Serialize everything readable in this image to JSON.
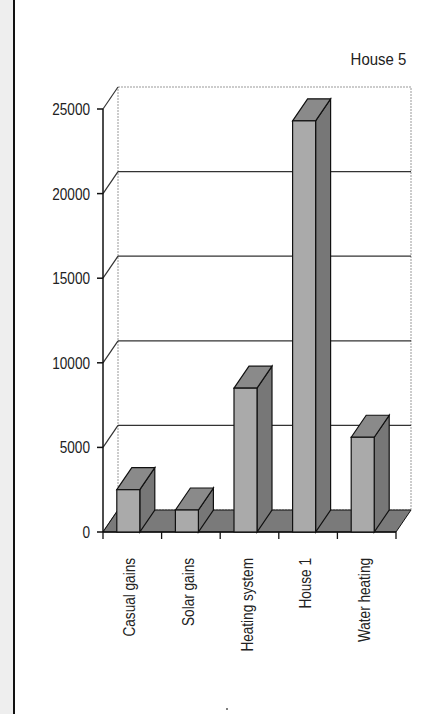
{
  "chart_data": {
    "type": "bar",
    "title": "House 5",
    "style": "3d-column",
    "categories": [
      "Casual gains",
      "Solar gains",
      "Heating system",
      "House 1",
      "Water heating"
    ],
    "series": [
      {
        "name": "House 5",
        "values": [
          2500,
          1300,
          8500,
          24300,
          5600
        ]
      }
    ],
    "xlabel": "",
    "ylabel": "",
    "ylim": [
      0,
      25000
    ],
    "yticks": [
      "0",
      "5000",
      "10000",
      "15000",
      "20000",
      "25000"
    ],
    "grid": true,
    "legend": null,
    "colors": {
      "bar_front": "#aaaaaa",
      "bar_side": "#777777",
      "bar_top": "#8a8a8a",
      "floor": "#7a7a7a"
    }
  },
  "header": {
    "title": "House 5"
  }
}
